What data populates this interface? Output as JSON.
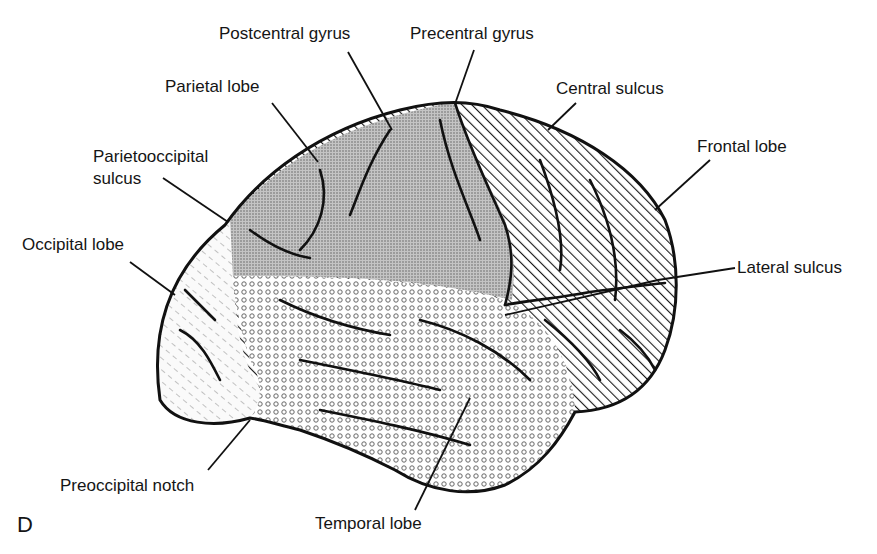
{
  "figure": {
    "panel_letter": "D",
    "colors": {
      "outline": "#111111",
      "parietal_fill": "#bdbdbd",
      "frontal_hatch": "#1a1a1a",
      "occipital_hatch": "#9a9a9a",
      "temporal_circles": "#666666",
      "background": "#ffffff"
    }
  },
  "labels": {
    "postcentral_gyrus": "Postcentral gyrus",
    "precentral_gyrus": "Precentral gyrus",
    "parietal_lobe": "Parietal lobe",
    "central_sulcus": "Central sulcus",
    "parietooccipital_sulcus_1": "Parietooccipital",
    "parietooccipital_sulcus_2": "sulcus",
    "frontal_lobe": "Frontal lobe",
    "occipital_lobe": "Occipital lobe",
    "lateral_sulcus": "Lateral sulcus",
    "preoccipital_notch": "Preoccipital notch",
    "temporal_lobe": "Temporal lobe"
  },
  "regions": [
    {
      "name": "Frontal lobe",
      "fill": "diagonal hatch"
    },
    {
      "name": "Parietal lobe",
      "fill": "fine stipple"
    },
    {
      "name": "Occipital lobe",
      "fill": "light dashed hatch"
    },
    {
      "name": "Temporal lobe",
      "fill": "small circles"
    }
  ]
}
